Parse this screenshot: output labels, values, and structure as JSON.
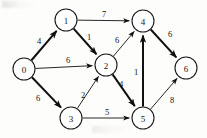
{
  "figure": {
    "title": "",
    "background_color": "#fdfdfc",
    "stroke_color": "#101010",
    "node_fill": "#ffffff"
  },
  "chart_data": {
    "type": "diagram",
    "diagram_type": "weighted-directed-graph",
    "title": "",
    "directed": true,
    "weighted": true,
    "node_radius": 11,
    "nodes": [
      {
        "id": "0",
        "label": "0",
        "x": 24,
        "y": 69
      },
      {
        "id": "1",
        "label": "1",
        "x": 66,
        "y": 20
      },
      {
        "id": "2",
        "label": "2",
        "x": 106,
        "y": 65
      },
      {
        "id": "3",
        "label": "3",
        "x": 71,
        "y": 118
      },
      {
        "id": "4",
        "label": "4",
        "x": 143,
        "y": 21
      },
      {
        "id": "5",
        "label": "5",
        "x": 143,
        "y": 118
      },
      {
        "id": "6",
        "label": "6",
        "x": 186,
        "y": 68
      }
    ],
    "edges": [
      {
        "from": "0",
        "to": "1",
        "weight": "4",
        "label_x": 39,
        "label_y": 41,
        "thick": true
      },
      {
        "from": "0",
        "to": "2",
        "weight": "6",
        "label_x": 68,
        "label_y": 60,
        "thick": false
      },
      {
        "from": "0",
        "to": "3",
        "weight": "6",
        "label_x": 38,
        "label_y": 98,
        "thick": true
      },
      {
        "from": "1",
        "to": "4",
        "weight": "7",
        "label_x": 104,
        "label_y": 14,
        "thick": false
      },
      {
        "from": "1",
        "to": "2",
        "weight": "1",
        "label_x": 89,
        "label_y": 37,
        "thick": true
      },
      {
        "from": "2",
        "to": "4",
        "weight": "6",
        "label_x": 117,
        "label_y": 40,
        "thick": false
      },
      {
        "from": "2",
        "to": "5",
        "weight": "4",
        "label_x": 121,
        "label_y": 84,
        "thick": true
      },
      {
        "from": "3",
        "to": "2",
        "weight": "2",
        "label_x": 83,
        "label_y": 95,
        "thick": false
      },
      {
        "from": "3",
        "to": "5",
        "weight": "5",
        "label_x": 107,
        "label_y": 112,
        "thick": false
      },
      {
        "from": "4",
        "to": "6",
        "weight": "6",
        "label_x": 170,
        "label_y": 34,
        "thick": true
      },
      {
        "from": "5",
        "to": "4",
        "weight": "1",
        "label_x": 136,
        "label_y": 72,
        "thick": true
      },
      {
        "from": "5",
        "to": "6",
        "weight": "8",
        "label_x": 172,
        "label_y": 100,
        "thick": false
      }
    ]
  }
}
